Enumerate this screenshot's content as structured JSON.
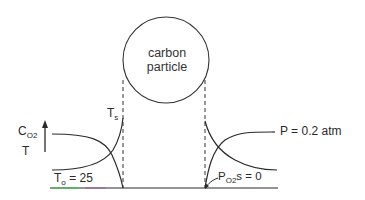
{
  "diagram": {
    "particle_label_line1": "carbon",
    "particle_label_line2": "particle",
    "left": {
      "axis_label_c": "C",
      "axis_label_sub": "O2",
      "axis_label_t": "T",
      "surface_temp_label": "T",
      "surface_temp_sub": "s",
      "ambient_temp_label": "T",
      "ambient_temp_sub": "o",
      "ambient_temp_value": " = 25"
    },
    "right": {
      "bulk_pressure_label": "P = 0.2 atm",
      "surface_pressure_p": "P",
      "surface_pressure_sub": "O2",
      "surface_pressure_s": "s",
      "surface_pressure_value": " = 0"
    },
    "colors": {
      "line": "#2a2a2a",
      "baseline_accent_green": "#3cc24a",
      "baseline_accent_purple": "#a23ca8"
    }
  }
}
